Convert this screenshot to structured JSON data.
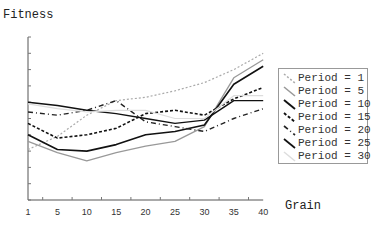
{
  "chart_data": {
    "type": "line",
    "title": "",
    "xlabel": "Grain",
    "ylabel": "Fitness",
    "x": [
      1,
      5,
      10,
      15,
      20,
      25,
      30,
      35,
      40
    ],
    "x_tick_labels": [
      "1",
      "5",
      "10",
      "15",
      "20",
      "25",
      "30",
      "35",
      "40"
    ],
    "ylim": [
      0,
      10
    ],
    "y_tick_labels_shown": false,
    "grid": false,
    "legend_position": "right",
    "series": [
      {
        "name": "Period = 1",
        "color": "#aaaaaa",
        "dash": "2,2",
        "width": 1.2,
        "values": [
          3.1,
          3.9,
          5.2,
          6.1,
          6.3,
          6.7,
          7.2,
          8.0,
          9.0
        ]
      },
      {
        "name": "Period = 5",
        "color": "#999999",
        "dash": "",
        "width": 1.3,
        "values": [
          3.6,
          2.9,
          2.4,
          2.9,
          3.3,
          3.6,
          4.5,
          7.5,
          8.6
        ]
      },
      {
        "name": "Period = 10",
        "color": "#111111",
        "dash": "",
        "width": 1.6,
        "values": [
          4.0,
          3.1,
          3.0,
          3.4,
          4.0,
          4.2,
          4.6,
          7.1,
          8.2
        ]
      },
      {
        "name": "Period = 15",
        "color": "#111111",
        "dash": "3,2",
        "width": 1.6,
        "values": [
          4.7,
          3.8,
          4.0,
          4.4,
          5.3,
          5.5,
          5.2,
          6.2,
          6.9
        ]
      },
      {
        "name": "Period = 20",
        "color": "#222222",
        "dash": "5,3,1,3",
        "width": 1.4,
        "values": [
          5.4,
          5.2,
          5.5,
          6.1,
          4.8,
          4.5,
          4.2,
          5.0,
          5.6
        ]
      },
      {
        "name": "Period = 25",
        "color": "#111111",
        "dash": "",
        "width": 1.4,
        "values": [
          6.0,
          5.8,
          5.5,
          5.3,
          5.0,
          4.7,
          4.9,
          6.1,
          6.1
        ]
      },
      {
        "name": "Period = 30",
        "color": "#dddddd",
        "dash": "",
        "width": 1.2,
        "values": [
          5.9,
          5.6,
          5.4,
          5.5,
          5.5,
          5.0,
          5.0,
          6.4,
          6.4
        ]
      }
    ]
  },
  "labels": {
    "ylabel": "Fitness",
    "xlabel": "Grain"
  },
  "legend": [
    {
      "label": "Period = 1"
    },
    {
      "label": "Period = 5"
    },
    {
      "label": "Period = 10"
    },
    {
      "label": "Period = 15"
    },
    {
      "label": "Period = 20"
    },
    {
      "label": "Period = 25"
    },
    {
      "label": "Period = 30"
    }
  ]
}
